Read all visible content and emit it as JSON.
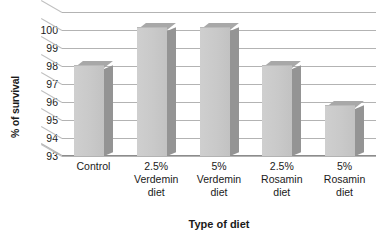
{
  "chart_data": {
    "type": "bar",
    "title": "",
    "xlabel": "Type of diet",
    "ylabel": "% of survival",
    "categories": [
      "Control",
      "2.5%\nVerdemin\ndiet",
      "5%\nVerdemin\ndiet",
      "2.5%\nRosamin\ndiet",
      "5%\nRosamin\ndiet"
    ],
    "values": [
      98.0,
      100.1,
      100.1,
      98.0,
      95.8
    ],
    "ylim": [
      93,
      101
    ],
    "yticks": [
      93,
      94,
      95,
      96,
      97,
      98,
      99,
      100
    ],
    "ytick_labels": [
      "93",
      "94",
      "95",
      "96",
      "97",
      "98",
      "99",
      "100"
    ],
    "grid": true,
    "legend": false,
    "style": "3d-column",
    "bar_face_color": "#c9c9c9",
    "bar_side_color": "#949494",
    "bar_top_color": "#a8a8a8",
    "gridline_color": "#b3b3b3",
    "background_color": "#ffffff"
  }
}
